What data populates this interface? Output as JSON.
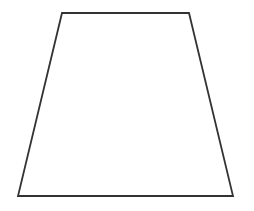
{
  "figure": {
    "shape": "trapezoid",
    "background": "#ffffff",
    "stroke": "#333333",
    "stroke_width": 1.8,
    "fill": "#ffffff",
    "vertices": [
      {
        "x": 62,
        "y": 13
      },
      {
        "x": 189,
        "y": 13
      },
      {
        "x": 233,
        "y": 196
      },
      {
        "x": 18,
        "y": 196
      }
    ]
  }
}
